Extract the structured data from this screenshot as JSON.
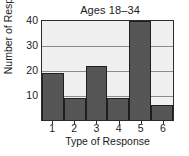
{
  "chart_data": {
    "type": "bar",
    "title": "Ages 18–34",
    "xlabel": "Type of Response",
    "ylabel": "Number of Responses",
    "categories": [
      "1",
      "2",
      "3",
      "4",
      "5",
      "6"
    ],
    "values": [
      19,
      9,
      22,
      9,
      40,
      6
    ],
    "ylim": [
      0,
      40
    ],
    "yticks": [
      10,
      20,
      30,
      40
    ],
    "ytick_labels": [
      "10",
      "20",
      "30",
      "40"
    ],
    "grid": true,
    "legend": null,
    "bar_color": "#565656",
    "plot_background": "#f0f0f0",
    "axis_color": "#2b2b2b",
    "gridline_color": "#8c8c8c",
    "bar_gap": 0
  }
}
